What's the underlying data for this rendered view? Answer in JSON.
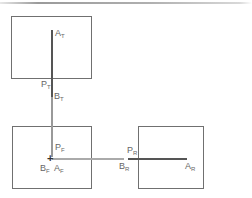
{
  "diagram": {
    "views": [
      {
        "name": "top",
        "box": [
          11,
          16,
          81,
          63
        ]
      },
      {
        "name": "front",
        "box": [
          12,
          126,
          80,
          63
        ]
      },
      {
        "name": "right",
        "box": [
          138,
          126,
          66,
          63
        ]
      }
    ],
    "labels": {
      "a_top": {
        "main": "A",
        "sub": "T"
      },
      "b_top": {
        "main": "B",
        "sub": "T"
      },
      "p_top": {
        "main": "P",
        "sub": "T"
      },
      "p_front": {
        "main": "P",
        "sub": "F"
      },
      "b_front": {
        "main": "B",
        "sub": "F"
      },
      "a_front": {
        "main": "A",
        "sub": "F"
      },
      "p_right": {
        "main": "P",
        "sub": "R"
      },
      "b_right": {
        "main": "B",
        "sub": "R"
      },
      "a_right": {
        "main": "A",
        "sub": "R"
      }
    },
    "point_marker": "+",
    "line_color": "#707070"
  }
}
